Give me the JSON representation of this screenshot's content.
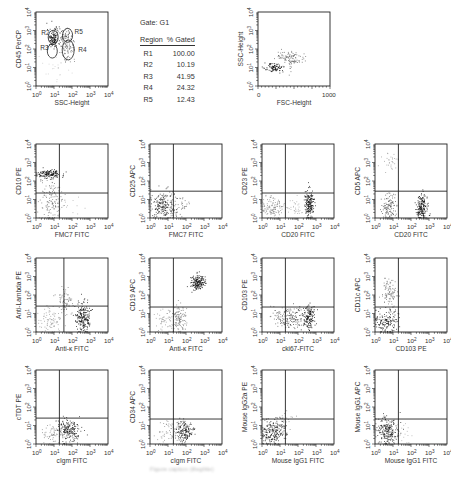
{
  "gate_table": {
    "title": "Gate: G1",
    "headers": [
      "Region",
      "% Gated"
    ],
    "rows": [
      {
        "region": "R1",
        "pct": "100.00"
      },
      {
        "region": "R2",
        "pct": "10.19"
      },
      {
        "region": "R3",
        "pct": "41.95"
      },
      {
        "region": "R4",
        "pct": "24.32"
      },
      {
        "region": "R5",
        "pct": "12.43"
      }
    ]
  },
  "caption": "Figure caption (illegible)",
  "chart_data": [
    {
      "type": "scatter",
      "id": "p0",
      "xlabel": "SSC-Height",
      "ylabel": "CD45 PerCP",
      "xscale": "log",
      "x_ticks": [
        "10^0",
        "10^1",
        "10^2",
        "10^3",
        "10^4"
      ],
      "y_ticks": [
        "10^0",
        "10^1",
        "10^2",
        "10^3",
        "10^4"
      ],
      "quadrant": null,
      "gates": [
        {
          "name": "R2",
          "x": 0.9,
          "y": 2.85
        },
        {
          "name": "R3",
          "x": 0.85,
          "y": 2.05
        },
        {
          "name": "R4",
          "x": 1.9,
          "y": 1.95
        },
        {
          "name": "R5",
          "x": 1.7,
          "y": 2.9
        }
      ],
      "clusters": [
        {
          "x": 0.95,
          "y": 2.6,
          "sx": 0.18,
          "sy": 0.28,
          "n": 120,
          "shade": "#111"
        },
        {
          "x": 1.65,
          "y": 2.7,
          "sx": 0.22,
          "sy": 0.25,
          "n": 60,
          "shade": "#555"
        },
        {
          "x": 1.75,
          "y": 2.05,
          "sx": 0.2,
          "sy": 0.3,
          "n": 80,
          "shade": "#777"
        },
        {
          "x": 1.2,
          "y": 1.0,
          "sx": 0.5,
          "sy": 0.5,
          "n": 25,
          "shade": "#ccc"
        }
      ]
    },
    {
      "type": "scatter",
      "id": "p1",
      "xlabel": "FSC-Height",
      "ylabel": "SSC-Height",
      "xscale": "linear",
      "x_ticks": [
        "0",
        "1000"
      ],
      "y_ticks": [
        "10^0",
        "10^1",
        "10^2",
        "10^3",
        "10^4"
      ],
      "quadrant": null,
      "clusters": [
        {
          "x": 0.22,
          "y": 1.0,
          "sx": 0.07,
          "sy": 0.12,
          "n": 90,
          "shade": "#111"
        },
        {
          "x": 0.45,
          "y": 1.5,
          "sx": 0.1,
          "sy": 0.22,
          "n": 110,
          "shade": "#666"
        }
      ]
    },
    {
      "type": "scatter",
      "id": "p2",
      "xlabel": "FMC7 FITC",
      "ylabel": "CD10 PE",
      "xscale": "log",
      "x_ticks": [
        "10^0",
        "10^1",
        "10^2",
        "10^3",
        "10^4"
      ],
      "y_ticks": [
        "10^0",
        "10^1",
        "10^2",
        "10^3",
        "10^4"
      ],
      "quadrant": {
        "x": 1.3,
        "y": 1.35
      },
      "clusters": [
        {
          "x": 0.7,
          "y": 2.4,
          "sx": 0.35,
          "sy": 0.12,
          "n": 150,
          "shade": "#111"
        },
        {
          "x": 0.8,
          "y": 1.0,
          "sx": 0.3,
          "sy": 0.6,
          "n": 140,
          "shade": "#777"
        },
        {
          "x": 2.0,
          "y": 0.8,
          "sx": 0.4,
          "sy": 0.3,
          "n": 10,
          "shade": "#aaa"
        }
      ]
    },
    {
      "type": "scatter",
      "id": "p3",
      "xlabel": "FMC7 FITC",
      "ylabel": "CD25 APC",
      "xscale": "log",
      "x_ticks": [
        "10^0",
        "10^1",
        "10^2",
        "10^3",
        "10^4"
      ],
      "y_ticks": [
        "10^0",
        "10^1",
        "10^2",
        "10^3",
        "10^4"
      ],
      "quadrant": {
        "x": 1.3,
        "y": 1.45
      },
      "clusters": [
        {
          "x": 0.7,
          "y": 0.7,
          "sx": 0.35,
          "sy": 0.35,
          "n": 200,
          "shade": "#333"
        },
        {
          "x": 1.5,
          "y": 0.6,
          "sx": 0.3,
          "sy": 0.3,
          "n": 50,
          "shade": "#666"
        }
      ]
    },
    {
      "type": "scatter",
      "id": "p4",
      "xlabel": "CD20 FITC",
      "ylabel": "CD23 PE",
      "xscale": "log",
      "x_ticks": [
        "10^0",
        "10^1",
        "10^2",
        "10^3",
        "10^4"
      ],
      "y_ticks": [
        "10^0",
        "10^1",
        "10^2",
        "10^3",
        "10^4"
      ],
      "quadrant": {
        "x": 1.3,
        "y": 1.35
      },
      "clusters": [
        {
          "x": 0.6,
          "y": 0.6,
          "sx": 0.3,
          "sy": 0.28,
          "n": 120,
          "shade": "#888"
        },
        {
          "x": 2.6,
          "y": 0.8,
          "sx": 0.12,
          "sy": 0.4,
          "n": 180,
          "shade": "#111"
        },
        {
          "x": 2.0,
          "y": 0.6,
          "sx": 0.4,
          "sy": 0.3,
          "n": 40,
          "shade": "#aaa"
        }
      ]
    },
    {
      "type": "scatter",
      "id": "p5",
      "xlabel": "CD20 FITC",
      "ylabel": "CD5 APC",
      "xscale": "log",
      "x_ticks": [
        "10^0",
        "10^1",
        "10^2",
        "10^3",
        "10^4"
      ],
      "y_ticks": [
        "10^0",
        "10^1",
        "10^2",
        "10^3",
        "10^4"
      ],
      "quadrant": {
        "x": 1.3,
        "y": 1.45
      },
      "clusters": [
        {
          "x": 0.8,
          "y": 3.0,
          "sx": 0.25,
          "sy": 0.25,
          "n": 30,
          "shade": "#999"
        },
        {
          "x": 0.8,
          "y": 0.6,
          "sx": 0.25,
          "sy": 0.35,
          "n": 110,
          "shade": "#555"
        },
        {
          "x": 2.6,
          "y": 0.6,
          "sx": 0.15,
          "sy": 0.35,
          "n": 180,
          "shade": "#111"
        }
      ]
    },
    {
      "type": "scatter",
      "id": "p6",
      "xlabel": "Anti-κ FITC",
      "ylabel": "Anti-Lambda PE",
      "xscale": "log",
      "x_ticks": [
        "10^0",
        "10^1",
        "10^2",
        "10^3",
        "10^4"
      ],
      "y_ticks": [
        "10^0",
        "10^1",
        "10^2",
        "10^3",
        "10^4"
      ],
      "quadrant": {
        "x": 1.55,
        "y": 1.4
      },
      "clusters": [
        {
          "x": 2.6,
          "y": 0.8,
          "sx": 0.2,
          "sy": 0.38,
          "n": 200,
          "shade": "#111"
        },
        {
          "x": 1.6,
          "y": 1.7,
          "sx": 0.2,
          "sy": 0.35,
          "n": 70,
          "shade": "#777"
        },
        {
          "x": 0.8,
          "y": 0.6,
          "sx": 0.35,
          "sy": 0.35,
          "n": 80,
          "shade": "#999"
        }
      ]
    },
    {
      "type": "scatter",
      "id": "p7",
      "xlabel": "Anti-κ FITC",
      "ylabel": "CD19 APC",
      "xscale": "log",
      "x_ticks": [
        "10^0",
        "10^1",
        "10^2",
        "10^3",
        "10^4"
      ],
      "y_ticks": [
        "10^0",
        "10^1",
        "10^2",
        "10^3",
        "10^4"
      ],
      "quadrant": {
        "x": 1.3,
        "y": 1.35
      },
      "clusters": [
        {
          "x": 2.6,
          "y": 2.7,
          "sx": 0.2,
          "sy": 0.2,
          "n": 170,
          "shade": "#111"
        },
        {
          "x": 1.6,
          "y": 0.7,
          "sx": 0.18,
          "sy": 0.4,
          "n": 110,
          "shade": "#777"
        },
        {
          "x": 0.8,
          "y": 0.6,
          "sx": 0.35,
          "sy": 0.35,
          "n": 60,
          "shade": "#999"
        }
      ]
    },
    {
      "type": "scatter",
      "id": "p8",
      "xlabel": "cki67-FITC",
      "ylabel": "CD103 PE",
      "xscale": "log",
      "x_ticks": [
        "10^0",
        "10^1",
        "10^2",
        "10^3",
        "10^4"
      ],
      "y_ticks": [
        "10^0",
        "10^1",
        "10^2",
        "10^3",
        "10^4"
      ],
      "quadrant": {
        "x": 1.3,
        "y": 1.35
      },
      "clusters": [
        {
          "x": 2.6,
          "y": 0.8,
          "sx": 0.15,
          "sy": 0.35,
          "n": 140,
          "shade": "#111"
        },
        {
          "x": 1.2,
          "y": 0.8,
          "sx": 0.35,
          "sy": 0.3,
          "n": 120,
          "shade": "#666"
        },
        {
          "x": 1.9,
          "y": 0.7,
          "sx": 0.3,
          "sy": 0.3,
          "n": 60,
          "shade": "#444"
        }
      ]
    },
    {
      "type": "scatter",
      "id": "p9",
      "xlabel": "CD103 PE",
      "ylabel": "CD11c APC",
      "xscale": "log",
      "x_ticks": [
        "10^0",
        "10^1",
        "10^2",
        "10^3",
        "10^4"
      ],
      "y_ticks": [
        "10^0",
        "10^1",
        "10^2",
        "10^3",
        "10^4"
      ],
      "quadrant": {
        "x": 1.3,
        "y": 1.35
      },
      "clusters": [
        {
          "x": 0.8,
          "y": 2.1,
          "sx": 0.22,
          "sy": 0.35,
          "n": 100,
          "shade": "#777"
        },
        {
          "x": 0.6,
          "y": 0.6,
          "sx": 0.3,
          "sy": 0.35,
          "n": 160,
          "shade": "#222"
        }
      ]
    },
    {
      "type": "scatter",
      "id": "p10",
      "xlabel": "cIgm FITC",
      "ylabel": "cTDT PE",
      "xscale": "log",
      "x_ticks": [
        "10^0",
        "10^1",
        "10^2",
        "10^3",
        "10^4"
      ],
      "y_ticks": [
        "10^0",
        "10^1",
        "10^2",
        "10^3",
        "10^4"
      ],
      "quadrant": {
        "x": 1.3,
        "y": 1.4
      },
      "clusters": [
        {
          "x": 1.8,
          "y": 0.8,
          "sx": 0.3,
          "sy": 0.3,
          "n": 200,
          "shade": "#222"
        },
        {
          "x": 0.9,
          "y": 0.6,
          "sx": 0.35,
          "sy": 0.3,
          "n": 60,
          "shade": "#888"
        }
      ]
    },
    {
      "type": "scatter",
      "id": "p11",
      "xlabel": "cIgm FITC",
      "ylabel": "CD34 APC",
      "xscale": "log",
      "x_ticks": [
        "10^0",
        "10^1",
        "10^2",
        "10^3",
        "10^4"
      ],
      "y_ticks": [
        "10^0",
        "10^1",
        "10^2",
        "10^3",
        "10^4"
      ],
      "quadrant": {
        "x": 1.3,
        "y": 1.35
      },
      "clusters": [
        {
          "x": 1.9,
          "y": 0.7,
          "sx": 0.25,
          "sy": 0.3,
          "n": 160,
          "shade": "#222"
        },
        {
          "x": 1.0,
          "y": 0.7,
          "sx": 0.35,
          "sy": 0.3,
          "n": 60,
          "shade": "#888"
        }
      ]
    },
    {
      "type": "scatter",
      "id": "p12",
      "xlabel": "Mouse IgG1 FITC",
      "ylabel": "Mouse IgG2a PE",
      "xscale": "log",
      "x_ticks": [
        "10^0",
        "10^1",
        "10^2",
        "10^3",
        "10^4"
      ],
      "y_ticks": [
        "10^0",
        "10^1",
        "10^2",
        "10^3",
        "10^4"
      ],
      "quadrant": {
        "x": 1.3,
        "y": 1.35
      },
      "clusters": [
        {
          "x": 0.6,
          "y": 0.7,
          "sx": 0.35,
          "sy": 0.35,
          "n": 220,
          "shade": "#222"
        },
        {
          "x": 1.3,
          "y": 1.3,
          "sx": 0.2,
          "sy": 0.2,
          "n": 20,
          "shade": "#888"
        }
      ]
    },
    {
      "type": "scatter",
      "id": "p13",
      "xlabel": "Mouse IgG1 FITC",
      "ylabel": "Mouse IgG1 APC",
      "xscale": "log",
      "x_ticks": [
        "10^0",
        "10^1",
        "10^2",
        "10^3",
        "10^4"
      ],
      "y_ticks": [
        "10^0",
        "10^1",
        "10^2",
        "10^3",
        "10^4"
      ],
      "quadrant": {
        "x": 1.3,
        "y": 1.35
      },
      "clusters": [
        {
          "x": 0.7,
          "y": 0.7,
          "sx": 0.3,
          "sy": 0.35,
          "n": 220,
          "shade": "#222"
        },
        {
          "x": 1.6,
          "y": 0.6,
          "sx": 0.3,
          "sy": 0.3,
          "n": 15,
          "shade": "#aaa"
        }
      ]
    }
  ]
}
